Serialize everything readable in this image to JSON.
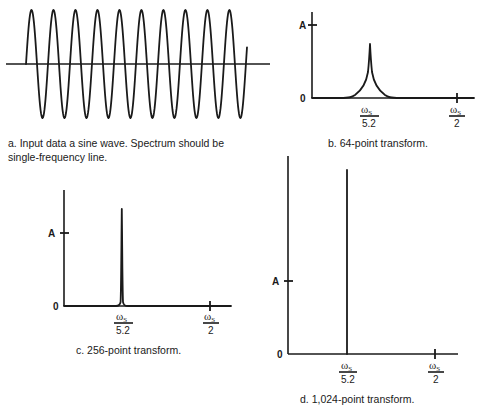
{
  "chart_data": [
    {
      "id": "a",
      "type": "line",
      "title": "a. Input data a sine wave. Spectrum should be single-frequency line.",
      "caption_line1": "a.  Input data a sine wave. Spectrum should be",
      "caption_line2": "single-frequency line.",
      "xlabel": "",
      "ylabel": "",
      "cycles": 10,
      "series": [
        {
          "name": "sine input",
          "function": "sin",
          "amplitude": 1,
          "cycles": 10
        }
      ],
      "grid": false
    },
    {
      "id": "b",
      "type": "line",
      "title": "b. 64-point transform.",
      "caption": "b.  64-point transform.",
      "y_tick_labels": [
        "0",
        "A"
      ],
      "x_tick_labels": [
        {
          "num": "ωs",
          "den": "5.2"
        },
        {
          "num": "ωs",
          "den": "2"
        }
      ],
      "peak_position": "ωs/5.2",
      "peak_height_relative_to_A": 0.75,
      "peak_shape": "broad",
      "grid": false
    },
    {
      "id": "c",
      "type": "line",
      "title": "c. 256-point transform.",
      "caption": "c.  256-point transform.",
      "y_tick_labels": [
        "0",
        "A"
      ],
      "x_tick_labels": [
        {
          "num": "ωs",
          "den": "5.2"
        },
        {
          "num": "ωs",
          "den": "2"
        }
      ],
      "peak_position": "ωs/5.2",
      "peak_height_relative_to_A": 1.4,
      "peak_shape": "narrow",
      "grid": false
    },
    {
      "id": "d",
      "type": "line",
      "title": "d. 1,024-point transform.",
      "caption": "d.  1,024-point transform.",
      "y_tick_labels": [
        "0",
        "A"
      ],
      "x_tick_labels": [
        {
          "num": "ωs",
          "den": "5.2"
        },
        {
          "num": "ωs",
          "den": "2"
        }
      ],
      "peak_position": "ωs/5.2",
      "peak_height_relative_to_A": 2.5,
      "peak_shape": "line",
      "grid": false
    }
  ],
  "labels": {
    "zero": "0",
    "amp": "A",
    "omega": "ω",
    "sub": "S",
    "den1": "5.2",
    "den2": "2"
  }
}
